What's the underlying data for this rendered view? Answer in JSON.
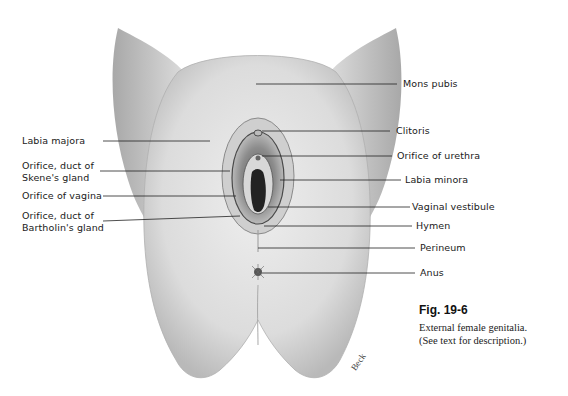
{
  "figure": {
    "number": "Fig. 19-6",
    "caption_line1": "External female genitalia.",
    "caption_line2": "(See text for description.)",
    "artist_signature": "Beck"
  },
  "labels_left": [
    {
      "id": "labia-majora",
      "text": "Labia majora"
    },
    {
      "id": "skene",
      "line1": "Orifice, duct of",
      "line2": "Skene's gland"
    },
    {
      "id": "vagina-orifice",
      "text": "Orifice of vagina"
    },
    {
      "id": "bartholin",
      "line1": "Orifice, duct of",
      "line2": "Bartholin's gland"
    }
  ],
  "labels_right": [
    {
      "id": "mons-pubis",
      "text": "Mons pubis"
    },
    {
      "id": "clitoris",
      "text": "Clitoris"
    },
    {
      "id": "urethra-orifice",
      "text": "Orifice of urethra"
    },
    {
      "id": "labia-minora",
      "text": "Labia minora"
    },
    {
      "id": "vaginal-vestibule",
      "text": "Vaginal vestibule"
    },
    {
      "id": "hymen",
      "text": "Hymen"
    },
    {
      "id": "perineum",
      "text": "Perineum"
    },
    {
      "id": "anus",
      "text": "Anus"
    }
  ],
  "colors": {
    "background": "#ffffff",
    "skin_light": "#e6e6e6",
    "skin_mid": "#c9c9c9",
    "skin_dark": "#9a9a9a",
    "leader_line": "#222222",
    "text": "#1a1a1a"
  }
}
